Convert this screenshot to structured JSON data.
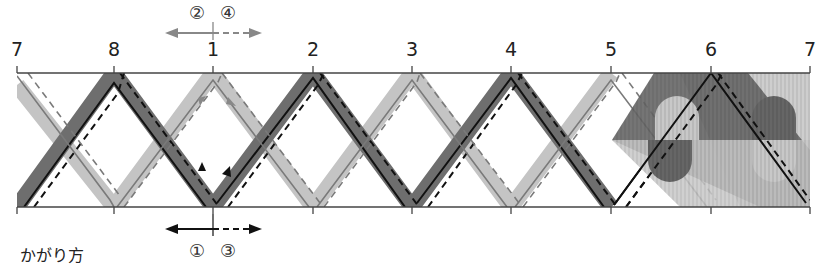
{
  "caption": "かがり方",
  "top_arrow": {
    "labels": [
      "②",
      "④"
    ],
    "left_style": "solid",
    "right_style": "dashed",
    "color": "#8a8a8a"
  },
  "bottom_arrow": {
    "labels": [
      "①",
      "③"
    ],
    "left_style": "solid",
    "right_style": "dashed",
    "color": "#111111"
  },
  "marks": [
    {
      "label": "7",
      "x": 17
    },
    {
      "label": "8",
      "x": 114
    },
    {
      "label": "1",
      "x": 213
    },
    {
      "label": "2",
      "x": 313
    },
    {
      "label": "3",
      "x": 412
    },
    {
      "label": "4",
      "x": 511
    },
    {
      "label": "5",
      "x": 611
    },
    {
      "label": "6",
      "x": 711
    },
    {
      "label": "7",
      "x": 810
    }
  ],
  "colors": {
    "dark_band": "#6e6e6e",
    "light_band": "#c4c4c4",
    "solid_line": "#111111",
    "gray_line": "#7a7a7a",
    "frame": "#444444"
  },
  "layout": {
    "top_y": 73,
    "bottom_y": 207,
    "left_x": 17,
    "right_x": 810
  }
}
